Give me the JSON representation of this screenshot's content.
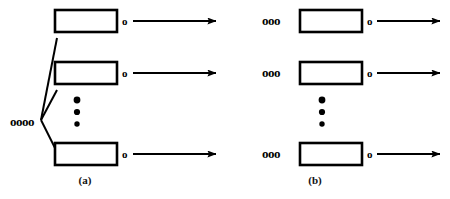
{
  "figure": {
    "type": "diagram",
    "background_color": "#ffffff",
    "ink_color": "#000000",
    "width": 450,
    "height": 199,
    "panels": [
      {
        "id": "a",
        "caption": "(a)",
        "description": "shared-input-fanout",
        "shared_input": {
          "label": "oooo",
          "circle_count": 4,
          "x": 10,
          "y": 122
        },
        "connector_lines": [
          {
            "x1": 41,
            "y1": 120,
            "x2": 57,
            "y2": 38
          },
          {
            "x1": 41,
            "y1": 120,
            "x2": 57,
            "y2": 90
          },
          {
            "x1": 41,
            "y1": 120,
            "x2": 57,
            "y2": 152
          }
        ],
        "rows": [
          {
            "box": {
              "x": 55,
              "y": 10,
              "width": 62,
              "height": 22
            },
            "output_circle": {
              "label": "o",
              "x": 122,
              "y": 21
            },
            "arrow": {
              "x1": 133,
              "y1": 21,
              "x2": 216,
              "y2": 21
            }
          },
          {
            "box": {
              "x": 55,
              "y": 62,
              "width": 62,
              "height": 22
            },
            "output_circle": {
              "label": "o",
              "x": 122,
              "y": 73
            },
            "arrow": {
              "x1": 133,
              "y1": 73,
              "x2": 216,
              "y2": 73
            }
          },
          {
            "box": {
              "x": 55,
              "y": 143,
              "width": 62,
              "height": 22
            },
            "output_circle": {
              "label": "o",
              "x": 122,
              "y": 154
            },
            "arrow": {
              "x1": 133,
              "y1": 154,
              "x2": 216,
              "y2": 154
            }
          }
        ],
        "ellipsis": {
          "dot_count": 3,
          "x": 77,
          "dot_y_values": [
            100,
            112,
            124
          ]
        }
      },
      {
        "id": "b",
        "caption": "(b)",
        "description": "independent-inputs-per-row",
        "rows": [
          {
            "input_circles": {
              "label": "ooo",
              "circle_count": 3,
              "x": 262,
              "y": 21
            },
            "box": {
              "x": 300,
              "y": 10,
              "width": 62,
              "height": 22
            },
            "output_circle": {
              "label": "o",
              "x": 367,
              "y": 21
            },
            "arrow": {
              "x1": 377,
              "y1": 21,
              "x2": 440,
              "y2": 21
            }
          },
          {
            "input_circles": {
              "label": "ooo",
              "circle_count": 3,
              "x": 262,
              "y": 73
            },
            "box": {
              "x": 300,
              "y": 62,
              "width": 62,
              "height": 22
            },
            "output_circle": {
              "label": "o",
              "x": 367,
              "y": 73
            },
            "arrow": {
              "x1": 377,
              "y1": 73,
              "x2": 440,
              "y2": 73
            }
          },
          {
            "input_circles": {
              "label": "ooo",
              "circle_count": 3,
              "x": 262,
              "y": 154
            },
            "box": {
              "x": 300,
              "y": 143,
              "width": 62,
              "height": 22
            },
            "output_circle": {
              "label": "o",
              "x": 367,
              "y": 154
            },
            "arrow": {
              "x1": 377,
              "y1": 154,
              "x2": 440,
              "y2": 154
            }
          }
        ],
        "ellipsis": {
          "dot_count": 3,
          "x": 322,
          "dot_y_values": [
            100,
            112,
            124
          ]
        }
      }
    ]
  }
}
